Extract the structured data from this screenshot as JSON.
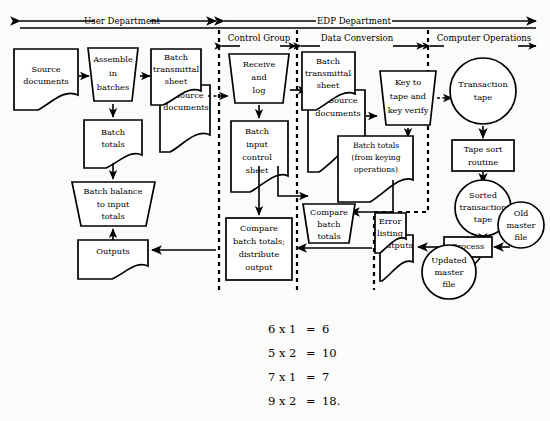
{
  "diagram": {
    "headers": {
      "top_level": [
        {
          "id": "user-department",
          "label": "User Department"
        },
        {
          "id": "edp-department",
          "label": "EDP Department"
        }
      ],
      "sub_level": [
        {
          "id": "control-group",
          "label": "Control Group"
        },
        {
          "id": "data-conversion",
          "label": "Data Conversion"
        },
        {
          "id": "computer-operations",
          "label": "Computer Operations"
        }
      ]
    },
    "nodes": {
      "source_documents_1": "Source\ndocuments",
      "assemble_in_batches": "Assemble\nin\nbatches",
      "batch_transmittal_sheet_1": "Batch\ntransmittal\nsheet",
      "source_documents_2": "Source\ndocuments",
      "batch_totals_user": "Batch\ntotals",
      "batch_balance_to_input_totals": "Batch balance\nto input\ntotals",
      "outputs_user": "Outputs",
      "receive_and_log": "Receive\nand\nlog",
      "batch_input_control_sheet": "Batch\ninput\ncontrol\nsheet",
      "compare_batch_totals_distribute_output": "Compare\nbatch totals;\ndistribute\noutput",
      "batch_transmittal_sheet_2": "Batch\ntransmittal\nsheet",
      "source_documents_3": "Source\ndocuments",
      "key_to_tape_and_key_verify": "Key to\ntape and\nkey  verify",
      "batch_totals_keying": "Batch  totals\n(from keying\noperations)",
      "compare_batch_totals": "Compare\nbatch\ntotals",
      "error_listing": "Error\nlisting",
      "outputs_edp": "Outputs",
      "transaction_tape": "Transaction\ntape",
      "tape_sort_routine": "Tape sort\nroutine",
      "sorted_transaction_tape": "Sorted\ntransaction\ntape",
      "old_master_file": "Old\nmaster\nfile",
      "process": "Process",
      "updated_master_file": "Updated\nmaster\nfile"
    },
    "node_lines": {
      "source_documents_1": [
        "Source",
        "documents"
      ],
      "assemble_in_batches": [
        "Assemble",
        "in",
        "batches"
      ],
      "batch_transmittal_sheet_1": [
        "Batch",
        "transmittal",
        "sheet"
      ],
      "source_documents_2": [
        "Source",
        "documents"
      ],
      "batch_totals_user": [
        "Batch",
        "totals"
      ],
      "batch_balance_to_input_totals": [
        "Batch  balance",
        "to input",
        "totals"
      ],
      "outputs_user": [
        "Outputs"
      ],
      "receive_and_log": [
        "Receive",
        "and",
        "log"
      ],
      "batch_input_control_sheet": [
        "Batch",
        "input",
        "control",
        "sheet"
      ],
      "compare_batch_totals_distribute_output": [
        "Compare",
        "batch totals;",
        "distribute",
        "output"
      ],
      "batch_transmittal_sheet_2": [
        "Batch",
        "transmittal",
        "sheet"
      ],
      "source_documents_3": [
        "Source",
        "documents"
      ],
      "key_to_tape_and_key_verify": [
        "Key to",
        "tape and",
        "key  verify"
      ],
      "batch_totals_keying": [
        "Batch  totals",
        "(from keying",
        "operations)"
      ],
      "compare_batch_totals": [
        "Compare",
        "batch",
        "totals"
      ],
      "error_listing": [
        "Error",
        "listing"
      ],
      "outputs_edp": [
        "Outputs"
      ],
      "transaction_tape": [
        "Transaction",
        "tape"
      ],
      "tape_sort_routine": [
        "Tape sort",
        "routine"
      ],
      "sorted_transaction_tape": [
        "Sorted",
        "transaction",
        "tape"
      ],
      "old_master_file": [
        "Old",
        "master",
        "file"
      ],
      "process": [
        "Process"
      ],
      "updated_master_file": [
        "Updated",
        "master",
        "file"
      ]
    }
  },
  "equations": [
    {
      "id": "eq-1",
      "left": "6 x 1",
      "eq": "=",
      "right": "6"
    },
    {
      "id": "eq-2",
      "left": "5 x 2",
      "eq": "=",
      "right": "10"
    },
    {
      "id": "eq-3",
      "left": "7 x 1",
      "eq": "=",
      "right": "7"
    },
    {
      "id": "eq-4",
      "left": "9 x 2",
      "eq": "=",
      "right": "18."
    }
  ],
  "colors": {
    "background": "#fbfbf9",
    "ink": "#000000",
    "shape_fill": "#ffffff"
  }
}
